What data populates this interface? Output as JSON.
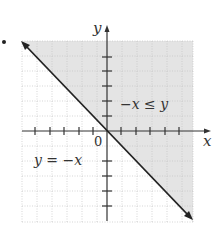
{
  "figure": {
    "bullet": "•",
    "axes": {
      "x_label": "x",
      "y_label": "y",
      "origin_label": "0",
      "x_ticks": [
        -5,
        -4,
        -3,
        -2,
        -1,
        1,
        2,
        3,
        4,
        5
      ],
      "y_ticks": [
        -5,
        -4,
        -3,
        -2,
        -1,
        1,
        2,
        3,
        4,
        5
      ],
      "range": [
        -6,
        6
      ]
    },
    "boundary_line": {
      "equation_label": "y = −x",
      "style": "solid",
      "arrows": "both ends"
    },
    "shaded_region": {
      "inequality_label": "−x ≤ y",
      "side": "above/right of line",
      "color": "#e6e6e6"
    },
    "grid": {
      "style": "dotted",
      "color": "#c8c8c8"
    }
  }
}
